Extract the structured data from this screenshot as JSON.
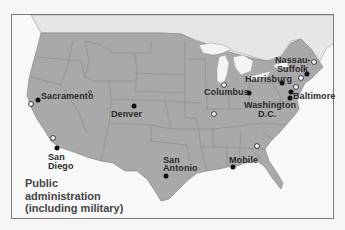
{
  "map": {
    "subject": "United States",
    "colors": {
      "us_land": "#a9a9a9",
      "other_land": "#e6e6e6",
      "water": "#f8f8f8",
      "state_border": "#8a8a8a",
      "frame_border": "#7a7a7a",
      "filled_marker": "#111111",
      "open_marker_fill": "#ffffff",
      "open_marker_stroke": "#333333",
      "label_text": "#2a2a2a"
    },
    "caption": {
      "lines": [
        "Public",
        "administration",
        "(including military)"
      ]
    },
    "legend_markers": {
      "filled": "filled-dot-icon",
      "open": "open-circle-icon"
    },
    "labeled_cities": [
      {
        "name": "Sacramento",
        "lines": [
          "Sacramento"
        ],
        "marker": "filled"
      },
      {
        "name": "Denver",
        "lines": [
          "Denver"
        ],
        "marker": "filled"
      },
      {
        "name": "Columbus",
        "lines": [
          "Columbus"
        ],
        "marker": "filled"
      },
      {
        "name": "Harrisburg",
        "lines": [
          "Harrisburg"
        ],
        "marker": "filled"
      },
      {
        "name": "Nassau-Suffolk",
        "lines": [
          "Nassau-",
          "Suffolk"
        ],
        "marker": "filled"
      },
      {
        "name": "Baltimore",
        "lines": [
          "Baltimore"
        ],
        "marker": "filled"
      },
      {
        "name": "Washington D.C.",
        "lines": [
          "Washington",
          "D.C."
        ],
        "marker": "filled"
      },
      {
        "name": "San Diego",
        "lines": [
          "San",
          "Diego"
        ],
        "marker": "filled"
      },
      {
        "name": "San Antonio",
        "lines": [
          "San",
          "Antonio"
        ],
        "marker": "filled"
      },
      {
        "name": "Mobile",
        "lines": [
          "Mobile"
        ],
        "marker": "filled"
      }
    ],
    "unlabeled_open_markers_count": 9
  }
}
